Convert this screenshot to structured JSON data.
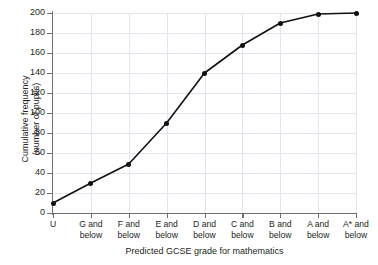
{
  "chart_data": {
    "type": "line",
    "title": "",
    "xlabel": "Predicted GCSE grade for mathematics",
    "ylabel_line1": "Cumulative frequency",
    "ylabel_line2": "(number of pupils)",
    "categories": [
      {
        "l1": "U",
        "l2": ""
      },
      {
        "l1": "G and",
        "l2": "below"
      },
      {
        "l1": "F and",
        "l2": "below"
      },
      {
        "l1": "E and",
        "l2": "below"
      },
      {
        "l1": "D and",
        "l2": "below"
      },
      {
        "l1": "C and",
        "l2": "below"
      },
      {
        "l1": "B and",
        "l2": "below"
      },
      {
        "l1": "A and",
        "l2": "below"
      },
      {
        "l1": "A* and",
        "l2": "below"
      }
    ],
    "values": [
      10,
      30,
      49,
      90,
      140,
      168,
      190,
      199,
      200
    ],
    "yticks": [
      0,
      20,
      40,
      60,
      80,
      100,
      120,
      140,
      160,
      180,
      200
    ],
    "ylim": [
      0,
      200
    ],
    "grid": true,
    "legend": "none",
    "colors": {
      "line": "#111111",
      "marker": "#111111",
      "grid": "#dfe6ee",
      "axis": "#6f6f6f",
      "text": "#231f20"
    }
  }
}
